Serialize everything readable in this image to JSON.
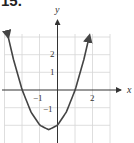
{
  "problem": {
    "number": "15."
  },
  "chart_data": {
    "type": "line",
    "title": "",
    "xlabel": "x",
    "ylabel": "y",
    "function": "y = x^2 + x - 2",
    "x": [
      -2.8,
      -2.5,
      -2,
      -1.5,
      -1,
      -0.5,
      0,
      0.5,
      1,
      1.5,
      1.8
    ],
    "series": [
      {
        "name": "parabola",
        "values": [
          3.04,
          1.75,
          0,
          -1.25,
          -2,
          -2.25,
          -2,
          -1.25,
          0,
          1.75,
          3.04
        ]
      }
    ],
    "xlim": [
      -3,
      3
    ],
    "ylim": [
      -3,
      3
    ],
    "x_tick_labels": [
      {
        "value": -1,
        "label": "−1"
      },
      {
        "value": 2,
        "label": "2"
      }
    ],
    "y_tick_labels": [
      {
        "value": 2,
        "label": "2"
      },
      {
        "value": 1,
        "label": "1"
      },
      {
        "value": -1,
        "label": "−1"
      }
    ],
    "roots": [
      -2,
      1
    ],
    "vertex": [
      -0.5,
      -2.25
    ],
    "y_intercept": -2,
    "grid": true,
    "arrows_on_curve_ends": true
  }
}
